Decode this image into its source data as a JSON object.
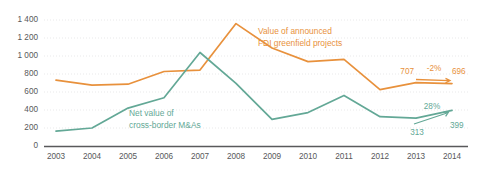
{
  "chart_data": {
    "type": "line",
    "title": "",
    "xlabel": "",
    "ylabel": "",
    "categories": [
      "2003",
      "2004",
      "2005",
      "2006",
      "2007",
      "2008",
      "2009",
      "2010",
      "2011",
      "2012",
      "2013",
      "2014"
    ],
    "ylim": [
      0,
      1400
    ],
    "yticks": [
      "0",
      "200",
      "400",
      "600",
      "800",
      "1 000",
      "1 200",
      "1 400"
    ],
    "ytick_values": [
      0,
      200,
      400,
      600,
      800,
      1000,
      1200,
      1400
    ],
    "grid": true,
    "legend_position": "inline-labels",
    "series": [
      {
        "name": "Value of announced FDI greenfield projects",
        "color": "#e8913c",
        "values": [
          735,
          680,
          690,
          830,
          845,
          1360,
          1090,
          940,
          965,
          630,
          707,
          696
        ]
      },
      {
        "name": "Net value of cross-border M&As",
        "color": "#63a896",
        "values": [
          170,
          205,
          425,
          540,
          1040,
          700,
          300,
          375,
          565,
          330,
          313,
          399
        ]
      }
    ],
    "annotations": {
      "orange_start_value": "707",
      "orange_change": "-2%",
      "orange_end_value": "696",
      "green_change": "28%",
      "green_start_value": "313",
      "green_end_value": "399"
    }
  },
  "labels": {
    "orange_line1": "Value of announced",
    "orange_line2": "FDI greenfield projects",
    "green_line1": "Net value of",
    "green_line2": "cross-border M&As"
  },
  "colors": {
    "orange": "#e8913c",
    "green": "#63a896",
    "axis": "#59595b",
    "grid": "#e9e9ea",
    "tick_text": "#58585a",
    "background": "#ffffff"
  }
}
